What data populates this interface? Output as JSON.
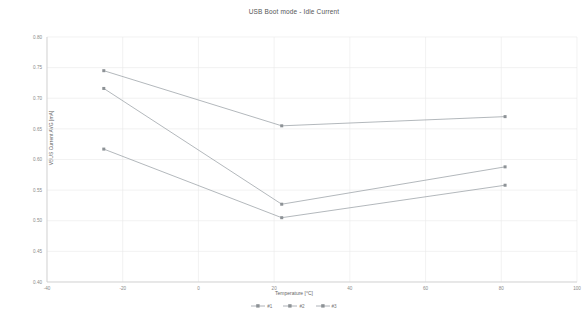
{
  "chart_data": {
    "type": "line",
    "title": "USB Boot mode - Idle Current",
    "xlabel": "Temperature [°C]",
    "ylabel": "VBUS Current AVG [mA]",
    "xlim": [
      -40,
      100
    ],
    "ylim": [
      0.4,
      0.8
    ],
    "xticks": [
      "-40",
      "-20",
      "0",
      "20",
      "40",
      "60",
      "80",
      "100"
    ],
    "xtick_values": [
      -40,
      -20,
      0,
      20,
      40,
      60,
      80,
      100
    ],
    "yticks": [
      "0.80",
      "0.75",
      "0.70",
      "0.65",
      "0.60",
      "0.55",
      "0.50",
      "0.45",
      "0.40"
    ],
    "ytick_values": [
      0.8,
      0.75,
      0.7,
      0.65,
      0.6,
      0.55,
      0.5,
      0.45,
      0.4
    ],
    "grid": true,
    "legend_position": "bottom",
    "x": [
      -25,
      22,
      81
    ],
    "series": [
      {
        "name": "#1",
        "color": "#9aa0a6",
        "values": [
          0.745,
          0.655,
          0.67
        ]
      },
      {
        "name": "#2",
        "color": "#9aa0a6",
        "values": [
          0.716,
          0.527,
          0.588
        ]
      },
      {
        "name": "#3",
        "color": "#9aa0a6",
        "values": [
          0.617,
          0.505,
          0.558
        ]
      }
    ]
  },
  "axis": {
    "grid_color": "#e9e9e9",
    "axis_color": "#c8c8c8"
  }
}
